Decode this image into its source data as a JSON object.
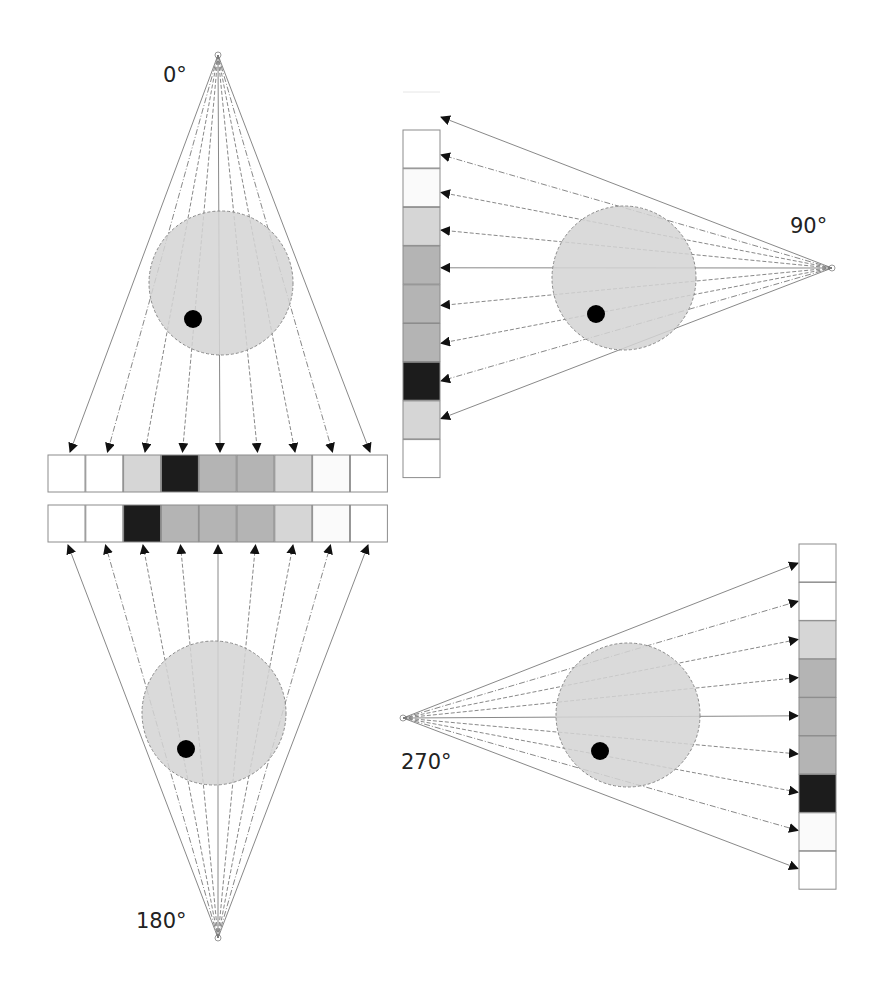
{
  "colors": {
    "phantom_fill": "#d4d4d4",
    "phantom_stroke": "#8a8a8a",
    "inclusion": "#000000",
    "ray": "#7a7a7a",
    "arrow": "#111111",
    "cell_border": "#8c8c8c"
  },
  "intensity_palette": {
    "white": "#ffffff",
    "near_white": "#fafafa",
    "light": "#d6d6d6",
    "medium": "#b4b4b4",
    "dark": "#1c1c1c"
  },
  "projections": [
    {
      "id": "p0",
      "label": "0°",
      "source_direction": "top",
      "detector_side": "below",
      "ray_count": 9,
      "cells": [
        "white",
        "white",
        "light",
        "dark",
        "medium",
        "medium",
        "light",
        "near_white",
        "white"
      ]
    },
    {
      "id": "p90",
      "label": "90°",
      "source_direction": "right",
      "detector_side": "left",
      "ray_count": 9,
      "cells": [
        "white",
        "near_white",
        "light",
        "medium",
        "medium",
        "medium",
        "dark",
        "light",
        "white"
      ]
    },
    {
      "id": "p180",
      "label": "180°",
      "source_direction": "bottom",
      "detector_side": "above",
      "ray_count": 9,
      "cells": [
        "white",
        "white",
        "dark",
        "medium",
        "medium",
        "medium",
        "light",
        "near_white",
        "white"
      ]
    },
    {
      "id": "p270",
      "label": "270°",
      "source_direction": "left",
      "detector_side": "right",
      "ray_count": 9,
      "cells": [
        "white",
        "white",
        "light",
        "medium",
        "medium",
        "medium",
        "dark",
        "near_white",
        "white"
      ]
    }
  ]
}
